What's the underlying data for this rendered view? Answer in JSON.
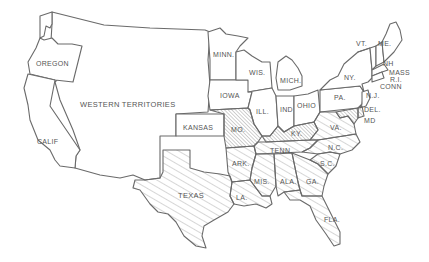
{
  "map": {
    "title": "United States, 1861",
    "legend_styles": {
      "seceded": "light diagonal hatching",
      "border": "dense diagonal hatching",
      "union": "no fill"
    },
    "colors": {
      "stroke": "#6a6a6a",
      "text": "#555555",
      "hatch": "#8a8a8a",
      "background": "#ffffff"
    },
    "labels": {
      "oregon": "OREGON",
      "western": "WESTERN TERRITORIES",
      "calif": "CALIF",
      "kansas": "KANSAS",
      "minn": "MINN.",
      "wis": "WIS.",
      "iowa": "IOWA",
      "mich": "MICH.",
      "ill": "ILL.",
      "ind": "IND",
      "ohio": "OHIO",
      "mo": "MO.",
      "ky": "KY.",
      "tenn": "TENN.",
      "ark": "ARK.",
      "texas": "TEXAS",
      "la": "LA.",
      "miss": "MIS.",
      "ala": "ALA.",
      "ga": "GA.",
      "fla": "FLA.",
      "sc": "S.C.",
      "nc": "N.C.",
      "va": "VA.",
      "pa": "PA.",
      "ny": "NY.",
      "vt": "VT.",
      "me": "ME.",
      "nh": "NH",
      "mass": "MASS",
      "ri": "R.I.",
      "conn": "CONN",
      "nj": "N.J.",
      "del": "DEL.",
      "md": "MD"
    },
    "states": [
      {
        "id": "oregon",
        "status": "union"
      },
      {
        "id": "calif",
        "status": "union"
      },
      {
        "id": "western",
        "status": "territory"
      },
      {
        "id": "kansas",
        "status": "union"
      },
      {
        "id": "minn",
        "status": "union"
      },
      {
        "id": "iowa",
        "status": "union"
      },
      {
        "id": "wis",
        "status": "union"
      },
      {
        "id": "mich",
        "status": "union"
      },
      {
        "id": "ill",
        "status": "union"
      },
      {
        "id": "ind",
        "status": "union"
      },
      {
        "id": "ohio",
        "status": "union"
      },
      {
        "id": "pa",
        "status": "union"
      },
      {
        "id": "ny",
        "status": "union"
      },
      {
        "id": "vt",
        "status": "union"
      },
      {
        "id": "nh",
        "status": "union"
      },
      {
        "id": "me",
        "status": "union"
      },
      {
        "id": "mass",
        "status": "union"
      },
      {
        "id": "ri",
        "status": "union"
      },
      {
        "id": "conn",
        "status": "union"
      },
      {
        "id": "nj",
        "status": "union"
      },
      {
        "id": "mo",
        "status": "border"
      },
      {
        "id": "ky",
        "status": "border"
      },
      {
        "id": "md",
        "status": "border"
      },
      {
        "id": "del",
        "status": "border"
      },
      {
        "id": "va",
        "status": "seceded"
      },
      {
        "id": "nc",
        "status": "seceded"
      },
      {
        "id": "sc",
        "status": "seceded"
      },
      {
        "id": "ga",
        "status": "seceded"
      },
      {
        "id": "fla",
        "status": "seceded"
      },
      {
        "id": "ala",
        "status": "seceded"
      },
      {
        "id": "miss",
        "status": "seceded"
      },
      {
        "id": "la",
        "status": "seceded"
      },
      {
        "id": "texas",
        "status": "seceded"
      },
      {
        "id": "ark",
        "status": "seceded"
      },
      {
        "id": "tenn",
        "status": "seceded"
      }
    ]
  }
}
